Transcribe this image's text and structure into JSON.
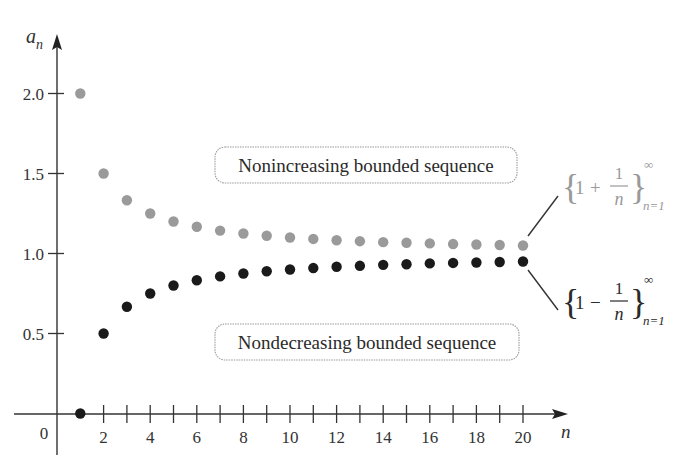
{
  "chart_data": {
    "type": "scatter",
    "title": "",
    "xlabel": "n",
    "ylabel": "a_n",
    "ylabel_main": "a",
    "ylabel_sub": "n",
    "xlim": [
      0,
      20
    ],
    "ylim": [
      0,
      2.0
    ],
    "grid": false,
    "x_ticks": [
      1,
      2,
      3,
      4,
      5,
      6,
      7,
      8,
      9,
      10,
      11,
      12,
      13,
      14,
      15,
      16,
      17,
      18,
      19,
      20
    ],
    "x_tick_labels": [
      "2",
      "4",
      "6",
      "8",
      "10",
      "12",
      "14",
      "16",
      "18",
      "20"
    ],
    "x_tick_label_values": [
      2,
      4,
      6,
      8,
      10,
      12,
      14,
      16,
      18,
      20
    ],
    "origin_label": "0",
    "y_ticks": [
      0.5,
      1.0,
      1.5,
      2.0
    ],
    "y_tick_labels": [
      "0.5",
      "1.0",
      "1.5",
      "2.0"
    ],
    "x": [
      1,
      2,
      3,
      4,
      5,
      6,
      7,
      8,
      9,
      10,
      11,
      12,
      13,
      14,
      15,
      16,
      17,
      18,
      19,
      20
    ],
    "series": [
      {
        "name": "{1 + 1/n} n=1 to ∞",
        "color": "#9a9a9a",
        "values": [
          2.0,
          1.5,
          1.333,
          1.25,
          1.2,
          1.167,
          1.143,
          1.125,
          1.111,
          1.1,
          1.091,
          1.083,
          1.077,
          1.071,
          1.067,
          1.063,
          1.059,
          1.056,
          1.053,
          1.05
        ]
      },
      {
        "name": "{1 − 1/n} n=1 to ∞",
        "color": "#1a1a1a",
        "values": [
          0.0,
          0.5,
          0.667,
          0.75,
          0.8,
          0.833,
          0.857,
          0.875,
          0.889,
          0.9,
          0.909,
          0.917,
          0.923,
          0.929,
          0.933,
          0.938,
          0.941,
          0.944,
          0.947,
          0.95
        ]
      }
    ],
    "annotations": [
      {
        "text": "Nonincreasing bounded sequence",
        "refers_to": "upper series"
      },
      {
        "text": "Nondecreasing bounded sequence",
        "refers_to": "lower series"
      }
    ]
  },
  "labels": {
    "box_upper": "Nonincreasing bounded sequence",
    "box_lower": "Nondecreasing bounded sequence",
    "formula_upper": {
      "one": "1",
      "op": "+",
      "num": "1",
      "den": "n",
      "sup": "∞",
      "sub": "n=1"
    },
    "formula_lower": {
      "one": "1",
      "op": "−",
      "num": "1",
      "den": "n",
      "sup": "∞",
      "sub": "n=1"
    }
  }
}
